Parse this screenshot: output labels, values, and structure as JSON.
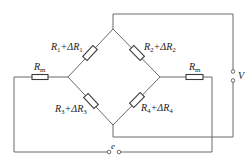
{
  "diagram": {
    "title": "",
    "type": "Wheatstone bridge circuit",
    "labels": {
      "r1": {
        "sym": "R",
        "sub": "1",
        "delta": "+ΔR",
        "dsub": "1"
      },
      "r2": {
        "sym": "R",
        "sub": "2",
        "delta": "+ΔR",
        "dsub": "2"
      },
      "r3": {
        "sym": "R",
        "sub": "3",
        "delta": "+ΔR",
        "dsub": "3"
      },
      "r4": {
        "sym": "R",
        "sub": "4",
        "delta": "+ΔR",
        "dsub": "4"
      },
      "rm_left": {
        "sym": "R",
        "sub": "m"
      },
      "rm_right": {
        "sym": "R",
        "sub": "m"
      },
      "output": "V",
      "source": "e"
    },
    "colors": {
      "wire": "#6a6a6a",
      "component": "#3a3a3a",
      "background": "#ffffff"
    }
  }
}
